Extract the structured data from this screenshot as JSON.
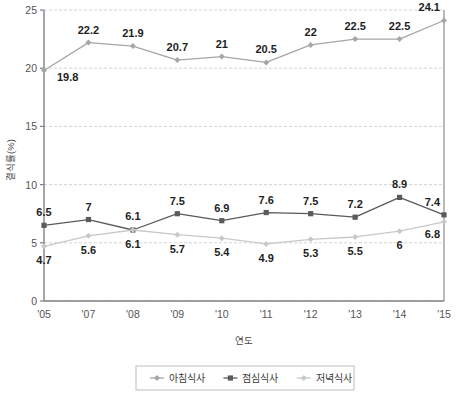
{
  "chart_data": {
    "type": "line",
    "title": "",
    "xlabel": "연도",
    "ylabel": "결식률(%)",
    "categories": [
      "'05",
      "'07",
      "'08",
      "'09",
      "'10",
      "'11",
      "'12",
      "'13",
      "'14",
      "'15"
    ],
    "ylim": [
      0,
      25
    ],
    "ytick_labels": [
      "0",
      "5",
      "10",
      "15",
      "20",
      "25"
    ],
    "yticks": [
      0,
      5,
      10,
      15,
      20,
      25
    ],
    "grid": true,
    "grid_style": "dashed-horizontal",
    "legend_position": "bottom",
    "series": [
      {
        "name": "아침식사",
        "color": "#a6a6a6",
        "marker": "diamond",
        "label_position": "above",
        "values": [
          19.8,
          22.2,
          21.9,
          20.7,
          21,
          20.5,
          22,
          22.5,
          22.5,
          24.1
        ],
        "value_labels": [
          "19.8",
          "22.2",
          "21.9",
          "20.7",
          "21",
          "20.5",
          "22",
          "22.5",
          "22.5",
          "24.1"
        ]
      },
      {
        "name": "점심식사",
        "color": "#5a5a5a",
        "marker": "square",
        "label_position": "above",
        "values": [
          6.5,
          7,
          6.1,
          7.5,
          6.9,
          7.6,
          7.5,
          7.2,
          8.9,
          7.4
        ],
        "value_labels": [
          "6.5",
          "7",
          "6.1",
          "7.5",
          "6.9",
          "7.6",
          "7.5",
          "7.2",
          "8.9",
          "7.4"
        ]
      },
      {
        "name": "저녁식사",
        "color": "#c8c8c8",
        "marker": "diamond",
        "label_position": "below",
        "values": [
          4.7,
          5.6,
          6.1,
          5.7,
          5.4,
          4.9,
          5.3,
          5.5,
          6,
          6.8
        ],
        "value_labels": [
          "4.7",
          "5.6",
          "6.1",
          "5.7",
          "5.4",
          "4.9",
          "5.3",
          "5.5",
          "6",
          "6.8"
        ]
      }
    ]
  },
  "colors": {
    "axis": "#808080",
    "grid": "#d4d4d4",
    "plot_border": "#8c8c8c",
    "legend_border": "#bdbdbd",
    "background": "#ffffff"
  }
}
